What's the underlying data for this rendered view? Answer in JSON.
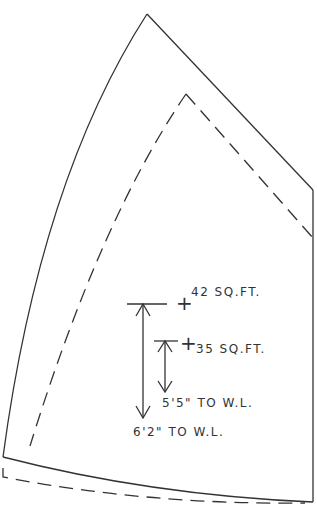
{
  "diagram": {
    "type": "sail-plan",
    "outline_color": "#333333",
    "labels": {
      "large_sail_area": "42 SQ.FT.",
      "small_sail_area": "35 SQ.FT.",
      "small_height": "5'5\" TO W.L.",
      "large_height": "6'2\" TO W.L."
    },
    "marks": {
      "center_of_effort": "+"
    }
  }
}
